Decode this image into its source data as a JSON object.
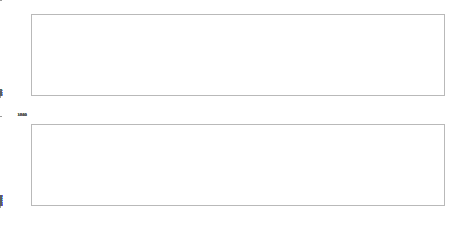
{
  "figure": {
    "background": "#ffffff",
    "line_color": "#808080",
    "axis_color": "#b9b9b9",
    "guide_color": "#4d4d4d",
    "tick_text_color": "#5a5a5a"
  },
  "chart_data": [
    {
      "type": "line",
      "id": "top-panel",
      "title": "",
      "xlabel": "",
      "ylabel": "",
      "ylim": [
        172.8,
        182.4
      ],
      "yticks": [
        174,
        176,
        178,
        180,
        182
      ],
      "ytick_labels": [
        "174",
        "176",
        "178",
        "180",
        "182"
      ],
      "grid": false,
      "legend": "none",
      "categories": [
        "10",
        "20",
        "30",
        "40",
        "50",
        "60",
        "70",
        "80",
        "90",
        "100",
        "110",
        "120",
        "130",
        "140",
        "150",
        "160",
        "170",
        "180",
        "190",
        "200"
      ],
      "x": [
        10,
        20,
        30,
        40,
        50,
        60,
        70,
        80,
        90,
        100,
        110,
        120,
        130,
        140,
        150,
        160,
        170,
        180,
        190,
        200
      ],
      "values": [
        182.0,
        182.0,
        181.1,
        181.0,
        180.1,
        180.0,
        179.1,
        179.1,
        178.0,
        178.0,
        177.1,
        177.1,
        176.1,
        176.1,
        175.1,
        175.1,
        174.1,
        174.1,
        173.2,
        173.2
      ],
      "annotations": [
        {
          "type": "vline",
          "x": 10,
          "style": "dotted"
        },
        {
          "type": "vline",
          "x": 200,
          "style": "dotted"
        }
      ]
    },
    {
      "type": "line",
      "id": "bottom-panel",
      "title": "",
      "xlabel": "",
      "ylabel": "",
      "ylim": [
        1732,
        1872
      ],
      "yticks": [
        1740,
        1760,
        1780,
        1800,
        1820,
        1840,
        1860
      ],
      "ytick_labels": [
        "1740",
        "1760",
        "1780",
        "1800",
        "1820",
        "1840",
        "1860"
      ],
      "grid": false,
      "legend": "none",
      "categories": [
        "1975G",
        "1986G",
        "1990",
        "2000",
        "2017",
        "2020C",
        "2021F",
        "2041T",
        "2046C",
        "2050C",
        "2066G",
        "2070G",
        "2084A",
        "2086A",
        "2100G",
        "2112G",
        "2117C",
        "2126G",
        "2140C",
        "2150C",
        "2166G",
        "2171G",
        "2184C",
        "2190G",
        "2200G",
        "2211A",
        "2220G",
        "2226G",
        "2243C",
        "2251T",
        "2264C",
        "2272C",
        "2286C",
        "2290G",
        "2300C",
        "2310G",
        "2312C",
        "2318T",
        "2321T",
        "2340G",
        "2356C",
        "2366G",
        "2371C",
        "2390T",
        "2397T",
        "2400G",
        "2414A",
        "2422A",
        "2434A",
        "2444A",
        "2457T",
        "2464C",
        "2471G",
        "2480C",
        "2490G",
        "2501G",
        "2510C",
        "2520C",
        "2530G",
        "2544C",
        "2550C",
        "2562C"
      ],
      "x": [
        0,
        1,
        2,
        3,
        4,
        5,
        6,
        7,
        8,
        9,
        10,
        11,
        12,
        13,
        14,
        15,
        16,
        17,
        18,
        19,
        20,
        21,
        22,
        23,
        24,
        25,
        26,
        27,
        28,
        29,
        30,
        31,
        32,
        33,
        34,
        35,
        36,
        37,
        38,
        39,
        40,
        41,
        42,
        43,
        44,
        45,
        46,
        47,
        48,
        49,
        50,
        51,
        52,
        53,
        54,
        55,
        56,
        57,
        58,
        59,
        60,
        61
      ],
      "values": [
        1866,
        1865,
        1864,
        1863,
        1862,
        1862,
        1861,
        1860,
        1859,
        1859,
        1858,
        1857,
        1857,
        1856,
        1856,
        1855,
        1854,
        1853,
        1846,
        1845,
        1845,
        1844,
        1844,
        1843,
        1843,
        1843,
        1843,
        1843,
        1843,
        1843,
        1843,
        1842,
        1842,
        1841,
        1822,
        1800,
        1782,
        1779,
        1778,
        1772,
        1764,
        1764,
        1764,
        1763,
        1763,
        1763,
        1763,
        1763,
        1763,
        1762,
        1762,
        1741,
        1740,
        1740,
        1740,
        1740,
        1739,
        1739,
        1738,
        1738,
        1737,
        1736
      ],
      "annotations": [
        {
          "type": "vline",
          "x": 17,
          "style": "dotted"
        },
        {
          "type": "vline",
          "x": 44,
          "style": "dotted"
        }
      ]
    }
  ]
}
